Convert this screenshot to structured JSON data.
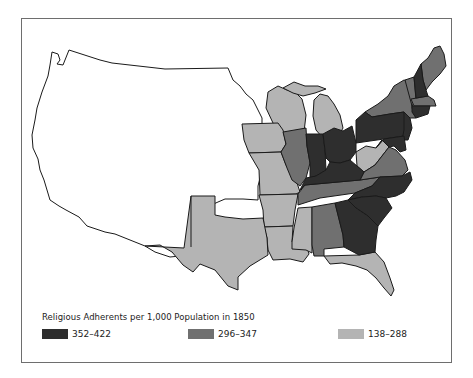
{
  "map": {
    "title": "Religious Adherents per 1,000 Population in 1850",
    "subject": "United States, 1850",
    "unshaded_region": "Western territories (no data)",
    "legend": [
      {
        "label": "352–422",
        "color": "#2e2e2e"
      },
      {
        "label": "296–347",
        "color": "#707070"
      },
      {
        "label": "138–288",
        "color": "#b4b4b4"
      }
    ],
    "states": {
      "dark": [
        "Ohio",
        "Indiana",
        "Kentucky",
        "Pennsylvania",
        "New Jersey",
        "Delaware",
        "North Carolina",
        "South Carolina",
        "Georgia",
        "New Hampshire",
        "Connecticut",
        "Rhode Island",
        "Maryland"
      ],
      "medium": [
        "Maine",
        "Vermont",
        "New York",
        "Massachusetts",
        "Illinois",
        "Tennessee",
        "Virginia",
        "Alabama"
      ],
      "light": [
        "Wisconsin",
        "Michigan",
        "Iowa",
        "Missouri",
        "Arkansas",
        "Louisiana",
        "Mississippi",
        "Texas",
        "Florida",
        "West Virginia"
      ]
    }
  }
}
